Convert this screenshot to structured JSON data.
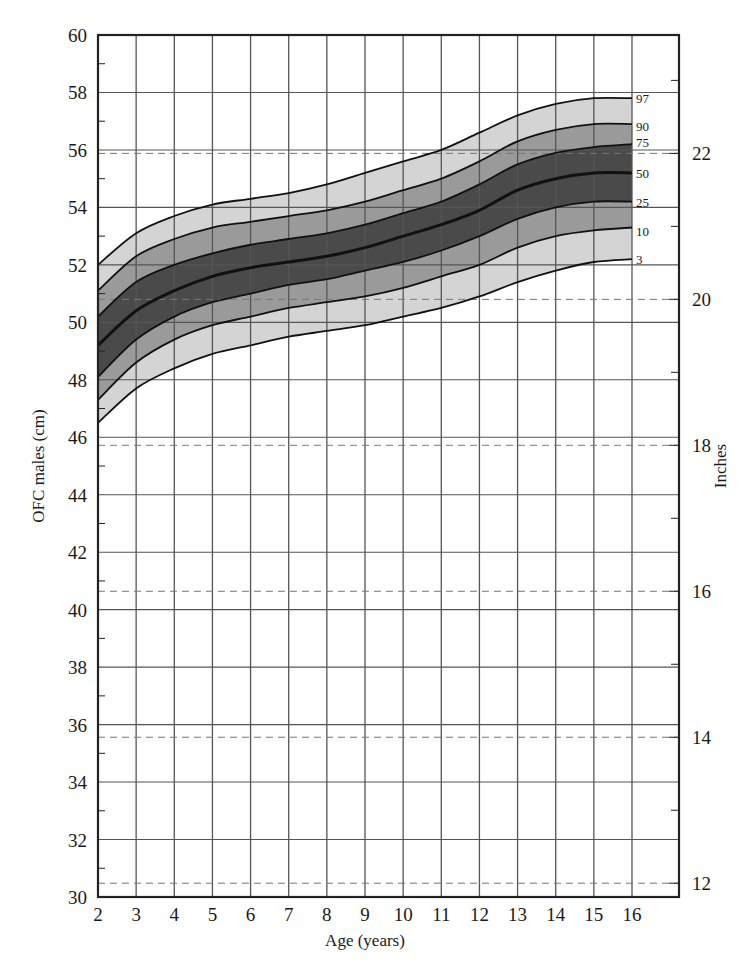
{
  "chart_data": {
    "type": "line",
    "title": "",
    "xlabel": "Age (years)",
    "ylabel": "OFC males (cm)",
    "y2label": "Inches",
    "x": [
      2,
      3,
      4,
      5,
      6,
      7,
      8,
      9,
      10,
      11,
      12,
      13,
      14,
      15,
      16
    ],
    "xlim": [
      2,
      17.2
    ],
    "ylim": [
      30,
      60
    ],
    "x_ticks": [
      "2",
      "3",
      "4",
      "5",
      "6",
      "7",
      "8",
      "9",
      "10",
      "11",
      "12",
      "13",
      "14",
      "15",
      "16"
    ],
    "y_ticks": [
      "30",
      "32",
      "34",
      "36",
      "38",
      "40",
      "42",
      "44",
      "46",
      "48",
      "50",
      "52",
      "54",
      "56",
      "58",
      "60"
    ],
    "y2_ticks": [
      {
        "label": "12",
        "inches": 12
      },
      {
        "label": "14",
        "inches": 14
      },
      {
        "label": "16",
        "inches": 16
      },
      {
        "label": "18",
        "inches": 18
      },
      {
        "label": "20",
        "inches": 20
      },
      {
        "label": "22",
        "inches": 22
      }
    ],
    "grid": true,
    "legend_position": "right-end-of-curves",
    "series": [
      {
        "name": "97",
        "values": [
          52.0,
          53.1,
          53.7,
          54.1,
          54.3,
          54.5,
          54.8,
          55.2,
          55.6,
          56.0,
          56.6,
          57.2,
          57.6,
          57.8,
          57.8
        ]
      },
      {
        "name": "90",
        "values": [
          51.1,
          52.3,
          52.9,
          53.3,
          53.5,
          53.7,
          53.9,
          54.2,
          54.6,
          55.0,
          55.6,
          56.3,
          56.7,
          56.9,
          56.9
        ]
      },
      {
        "name": "75",
        "values": [
          50.2,
          51.4,
          52.0,
          52.4,
          52.7,
          52.9,
          53.1,
          53.4,
          53.8,
          54.2,
          54.8,
          55.5,
          55.9,
          56.1,
          56.2
        ]
      },
      {
        "name": "50",
        "values": [
          49.2,
          50.4,
          51.1,
          51.6,
          51.9,
          52.1,
          52.3,
          52.6,
          53.0,
          53.4,
          53.9,
          54.6,
          55.0,
          55.2,
          55.2
        ]
      },
      {
        "name": "25",
        "values": [
          48.1,
          49.4,
          50.2,
          50.7,
          51.0,
          51.3,
          51.5,
          51.8,
          52.1,
          52.5,
          53.0,
          53.6,
          54.0,
          54.2,
          54.2
        ]
      },
      {
        "name": "10",
        "values": [
          47.3,
          48.6,
          49.4,
          49.9,
          50.2,
          50.5,
          50.7,
          50.9,
          51.2,
          51.6,
          52.0,
          52.6,
          53.0,
          53.2,
          53.3
        ]
      },
      {
        "name": "3",
        "values": [
          46.5,
          47.7,
          48.4,
          48.9,
          49.2,
          49.5,
          49.7,
          49.9,
          50.2,
          50.5,
          50.9,
          51.4,
          51.8,
          52.1,
          52.2
        ]
      }
    ],
    "bands": [
      {
        "between": [
          "90",
          "97"
        ],
        "color": "#d4d4d4"
      },
      {
        "between": [
          "75",
          "90"
        ],
        "color": "#9a9a9a"
      },
      {
        "between": [
          "25",
          "75"
        ],
        "color": "#4a4a4a"
      },
      {
        "between": [
          "10",
          "25"
        ],
        "color": "#9a9a9a"
      },
      {
        "between": [
          "3",
          "10"
        ],
        "color": "#d4d4d4"
      }
    ]
  },
  "colors": {
    "grid": "#555555",
    "frame": "#222222",
    "curve": "#111111",
    "inch_dash": "#777777"
  }
}
